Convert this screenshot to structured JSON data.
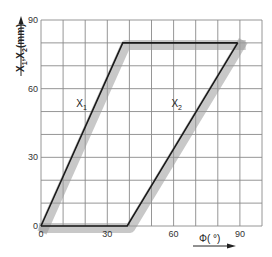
{
  "chart_data": {
    "type": "line",
    "title": "",
    "xlabel": "Φ( °)",
    "ylabel": "X1,X2(mm)",
    "xlim": [
      0,
      100
    ],
    "ylim": [
      0,
      90
    ],
    "grid": true,
    "grid_step_x": 10,
    "grid_step_y": 10,
    "x_ticks": [
      0,
      30,
      60,
      90
    ],
    "y_ticks": [
      0,
      30,
      60,
      90
    ],
    "x_tick_labels": [
      "0",
      "30",
      "60",
      "90"
    ],
    "y_tick_labels": [
      "0",
      "30",
      "60",
      "90"
    ],
    "series": [
      {
        "name": "X1",
        "label_main": "X",
        "label_sub": "1",
        "points": [
          [
            0,
            0
          ],
          [
            37,
            80
          ],
          [
            89,
            80
          ]
        ],
        "label_at": [
          16,
          52
        ]
      },
      {
        "name": "X2",
        "label_main": "X",
        "label_sub": "2",
        "points": [
          [
            0,
            0
          ],
          [
            39,
            0
          ],
          [
            89,
            80
          ]
        ],
        "label_at": [
          59,
          52
        ]
      }
    ],
    "colors": {
      "line": "#1a1a1a",
      "shadow": "#9a9a9a",
      "grid": "#8a8a8a"
    },
    "legend": "none"
  },
  "axis_labels": {
    "y_main": "X",
    "y_sub1": "1",
    "y_sep": ",X",
    "y_sub2": "2",
    "y_unit": "(mm)",
    "x_text": "Φ( °)"
  }
}
